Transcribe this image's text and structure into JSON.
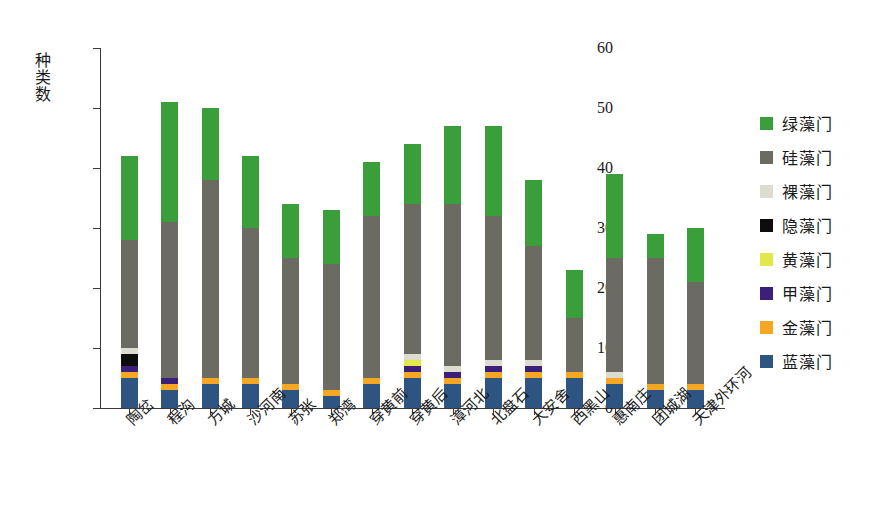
{
  "chart_data": {
    "type": "bar",
    "stacked": true,
    "title": "",
    "xlabel": "",
    "ylabel": "种类数",
    "ylim": [
      0,
      60
    ],
    "yticks": [
      0,
      10,
      20,
      30,
      40,
      50,
      60
    ],
    "grid": false,
    "legend_position": "right",
    "categories": [
      "陶岔",
      "程沟",
      "方城",
      "沙河南",
      "苏张",
      "郑湾",
      "穿黄前",
      "穿黄后",
      "漳河北",
      "北盘石",
      "大安舍",
      "西黑山",
      "惠南庄",
      "团城湖",
      "天津外环河"
    ],
    "series": [
      {
        "name": "蓝藻门",
        "color": "#2e5481",
        "values": [
          5,
          3,
          4,
          4,
          3,
          2,
          4,
          5,
          4,
          5,
          5,
          5,
          4,
          3,
          3
        ]
      },
      {
        "name": "金藻门",
        "color": "#f5a623",
        "values": [
          1,
          1,
          1,
          1,
          1,
          1,
          1,
          1,
          1,
          1,
          1,
          1,
          1,
          1,
          1
        ]
      },
      {
        "name": "甲藻门",
        "color": "#3c1f78",
        "values": [
          1,
          1,
          0,
          0,
          0,
          0,
          0,
          1,
          1,
          1,
          1,
          0,
          0,
          0,
          0
        ]
      },
      {
        "name": "黄藻门",
        "color": "#e0e84a",
        "values": [
          0,
          0,
          0,
          0,
          0,
          0,
          0,
          1,
          0,
          0,
          0,
          0,
          0,
          0,
          0
        ]
      },
      {
        "name": "隐藻门",
        "color": "#0d0d0d",
        "values": [
          2,
          0,
          0,
          0,
          0,
          0,
          0,
          0,
          0,
          0,
          0,
          0,
          0,
          0,
          0
        ]
      },
      {
        "name": "裸藻门",
        "color": "#dcdcd0",
        "values": [
          1,
          0,
          0,
          0,
          0,
          0,
          0,
          1,
          1,
          1,
          1,
          0,
          1,
          0,
          0
        ]
      },
      {
        "name": "硅藻门",
        "color": "#6b6b63",
        "values": [
          18,
          26,
          33,
          25,
          21,
          21,
          27,
          25,
          27,
          24,
          19,
          9,
          19,
          21,
          17
        ]
      },
      {
        "name": "绿藻门",
        "color": "#3a9e3a",
        "values": [
          14,
          20,
          12,
          12,
          9,
          9,
          9,
          10,
          13,
          15,
          11,
          8,
          14,
          4,
          9
        ]
      }
    ],
    "totals": [
      42,
      51,
      50,
      42.7,
      33.8,
      33,
      41,
      44,
      48.8,
      46.8,
      37,
      22.8,
      39,
      28.8,
      30
    ]
  },
  "legend": {
    "items": [
      {
        "label": "绿藻门",
        "color": "#3a9e3a"
      },
      {
        "label": "硅藻门",
        "color": "#6b6b63"
      },
      {
        "label": "裸藻门",
        "color": "#dcdcd0"
      },
      {
        "label": "隐藻门",
        "color": "#0d0d0d"
      },
      {
        "label": "黄藻门",
        "color": "#e0e84a"
      },
      {
        "label": "甲藻门",
        "color": "#3c1f78"
      },
      {
        "label": "金藻门",
        "color": "#f5a623"
      },
      {
        "label": "蓝藻门",
        "color": "#2e5481"
      }
    ]
  },
  "axis": {
    "y_label": "种类数",
    "y_tick_labels": [
      "0",
      "10",
      "20",
      "30",
      "40",
      "50",
      "60"
    ]
  }
}
